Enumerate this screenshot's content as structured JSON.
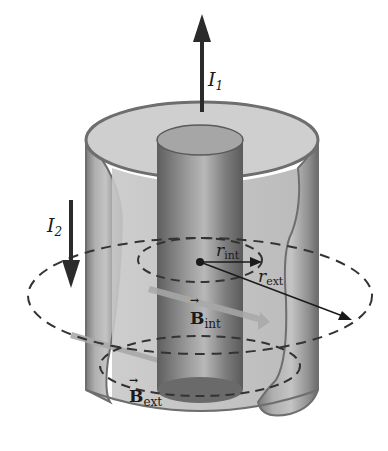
{
  "diagram": {
    "labels": {
      "I1": {
        "main": "I",
        "sub": "1"
      },
      "I2": {
        "main": "I",
        "sub": "2"
      },
      "r_int": {
        "main": "r",
        "sub": "int"
      },
      "r_ext": {
        "main": "r",
        "sub": "ext"
      },
      "B_int": {
        "main": "B",
        "sub": "int",
        "arrow": "→"
      },
      "B_ext": {
        "main": "B",
        "sub": "ext",
        "arrow": "→"
      }
    },
    "colors": {
      "outer_shell": "#9a9a9a",
      "outer_shell_edge": "#6e6e6e",
      "inner_conductor": "#8c8c8c",
      "top_annulus": "#cfcfcf",
      "arrow": "#2b2b2b",
      "field_arrow": "#a8a8a8",
      "dashed": "#333333"
    }
  }
}
